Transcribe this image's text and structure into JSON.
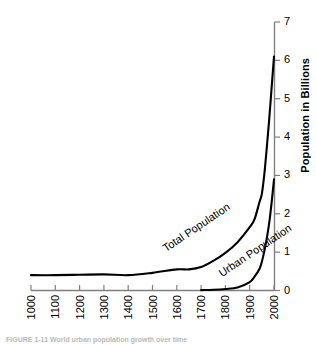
{
  "chart_data": {
    "type": "line",
    "title": "",
    "xlabel": "",
    "ylabel": "Population in Billions",
    "xlim": [
      1000,
      2000
    ],
    "ylim": [
      0,
      7
    ],
    "grid": false,
    "legend_position": "inline-curve-labels",
    "y_axis_side": "right",
    "x_tick_labels": [
      "1000",
      "1100",
      "1200",
      "1300",
      "1400",
      "1500",
      "1600",
      "1700",
      "1800",
      "1900",
      "2000"
    ],
    "x_ticks": [
      1000,
      1100,
      1200,
      1300,
      1400,
      1500,
      1600,
      1700,
      1800,
      1900,
      2000
    ],
    "y_tick_labels": [
      "0",
      "1",
      "2",
      "3",
      "4",
      "5",
      "6",
      "7"
    ],
    "y_ticks": [
      0,
      1,
      2,
      3,
      4,
      5,
      6,
      7
    ],
    "series": [
      {
        "name": "Total Population",
        "label": "Total Population",
        "color": "#000000",
        "x": [
          1000,
          1100,
          1200,
          1300,
          1400,
          1500,
          1600,
          1650,
          1700,
          1750,
          1800,
          1850,
          1900,
          1920,
          1940,
          1950,
          1960,
          1970,
          1980,
          1990,
          2000
        ],
        "values": [
          0.4,
          0.4,
          0.41,
          0.42,
          0.4,
          0.46,
          0.55,
          0.55,
          0.61,
          0.77,
          0.98,
          1.26,
          1.65,
          1.86,
          2.3,
          2.52,
          3.02,
          3.7,
          4.44,
          5.27,
          6.1
        ]
      },
      {
        "name": "Urban Population",
        "label": "Urban Population",
        "color": "#000000",
        "x": [
          1700,
          1750,
          1800,
          1850,
          1900,
          1920,
          1940,
          1950,
          1960,
          1970,
          1980,
          1990,
          2000
        ],
        "values": [
          0.01,
          0.02,
          0.04,
          0.08,
          0.22,
          0.36,
          0.56,
          0.75,
          1.02,
          1.35,
          1.75,
          2.28,
          2.9
        ]
      }
    ],
    "annotations": [
      {
        "text": "Total Population",
        "x": 1560,
        "y": 0.95
      },
      {
        "text": "Urban Population",
        "x": 1790,
        "y": 0.3
      }
    ]
  },
  "caption": {
    "text": "FIGURE 1-11   World urban population growth over time"
  }
}
